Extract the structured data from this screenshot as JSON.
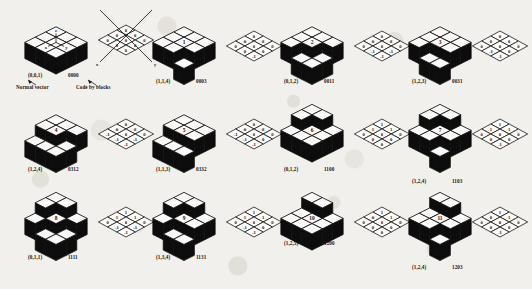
{
  "figure": {
    "type": "diagram",
    "title_visible": false,
    "background_color": "#f2f0ec",
    "ink_color": "#0d0d0d",
    "paper_color": "#fbfaf8",
    "description_visible_text": [
      "Normal vector",
      "Code by blocks"
    ],
    "rows": 3,
    "columns": 4,
    "pairs_per_cell": 2,
    "grid_size": "3x3"
  },
  "annotations": {
    "normal_vector_label": "Normal vector",
    "code_by_blocks_label": "Code by blocks",
    "first_normal_vector": "(0,0,1)",
    "first_code": "0000",
    "axis_x_label": "x",
    "axis_y_label": "y",
    "inset_axis_labels": [
      "z",
      "y",
      "x"
    ]
  },
  "panels": [
    {
      "index": 0,
      "cube_number": "",
      "normal_vector": "(0,0,1)",
      "code": "0000",
      "has_leader_lines": true,
      "has_axes": true,
      "heights": [
        [
          0,
          0,
          0
        ],
        [
          0,
          0,
          0
        ],
        [
          0,
          0,
          0
        ]
      ],
      "grid_values": [
        [
          "0",
          "0",
          "0"
        ],
        [
          "0",
          "0",
          "0"
        ],
        [
          "0",
          "0",
          "0"
        ]
      ]
    },
    {
      "index": 1,
      "cube_number": "1",
      "normal_vector": "(1,1,4)",
      "code": "0003",
      "has_leader_lines": false,
      "has_axes": false,
      "heights": [
        [
          0,
          0,
          0
        ],
        [
          0,
          0,
          0
        ],
        [
          0,
          0,
          -1
        ]
      ],
      "grid_values": [
        [
          "0",
          "0",
          "0"
        ],
        [
          "0",
          "0",
          "0"
        ],
        [
          "0",
          "0",
          "-1"
        ]
      ]
    },
    {
      "index": 2,
      "cube_number": "2",
      "normal_vector": "(0,1,2)",
      "code": "0011",
      "has_leader_lines": false,
      "has_axes": false,
      "heights": [
        [
          0,
          0,
          0
        ],
        [
          0,
          0,
          -1
        ],
        [
          0,
          -1,
          -1
        ]
      ],
      "grid_values": [
        [
          "0",
          "0",
          "0"
        ],
        [
          "0",
          "0",
          "-1"
        ],
        [
          "0",
          "-1",
          "-1"
        ]
      ]
    },
    {
      "index": 3,
      "cube_number": "3",
      "normal_vector": "(1,2,3)",
      "code": "0031",
      "has_leader_lines": false,
      "has_axes": false,
      "heights": [
        [
          0,
          0,
          0
        ],
        [
          0,
          0,
          0
        ],
        [
          0,
          -1,
          -1
        ]
      ],
      "grid_values": [
        [
          "0",
          "0",
          "0"
        ],
        [
          "0",
          "0",
          "0"
        ],
        [
          "0",
          "-1",
          "-1"
        ]
      ]
    },
    {
      "index": 4,
      "cube_number": "4",
      "normal_vector": "(1,2,4)",
      "code": "0312",
      "has_leader_lines": false,
      "has_axes": false,
      "heights": [
        [
          0,
          0,
          0
        ],
        [
          0,
          0,
          -1
        ],
        [
          -1,
          -1,
          -1
        ]
      ],
      "grid_values": [
        [
          "0",
          "0",
          "0"
        ],
        [
          "0",
          "0",
          "-1"
        ],
        [
          "-1",
          "-1",
          "-1"
        ]
      ]
    },
    {
      "index": 5,
      "cube_number": "5",
      "normal_vector": "(1,1,3)",
      "code": "0332",
      "has_leader_lines": false,
      "has_axes": false,
      "heights": [
        [
          0,
          0,
          0
        ],
        [
          0,
          0,
          0
        ],
        [
          -1,
          -1,
          -1
        ]
      ],
      "grid_values": [
        [
          "0",
          "0",
          "0"
        ],
        [
          "0",
          "0",
          "0"
        ],
        [
          "-1",
          "-1",
          "-1"
        ]
      ]
    },
    {
      "index": 6,
      "cube_number": "6",
      "normal_vector": "(0,1,2)",
      "code": "1100",
      "has_leader_lines": false,
      "has_axes": false,
      "heights": [
        [
          1,
          1,
          0
        ],
        [
          1,
          0,
          0
        ],
        [
          0,
          0,
          0
        ]
      ],
      "grid_values": [
        [
          "1",
          "1",
          "0"
        ],
        [
          "1",
          "0",
          "0"
        ],
        [
          "0",
          "0",
          "0"
        ]
      ]
    },
    {
      "index": 7,
      "cube_number": "7",
      "normal_vector": "(1,2,4)",
      "code": "1103",
      "has_leader_lines": false,
      "has_axes": false,
      "heights": [
        [
          1,
          1,
          0
        ],
        [
          1,
          0,
          0
        ],
        [
          0,
          0,
          -1
        ]
      ],
      "grid_values": [
        [
          "1",
          "1",
          "0"
        ],
        [
          "1",
          "0",
          "0"
        ],
        [
          "0",
          "0",
          "-1"
        ]
      ]
    },
    {
      "index": 8,
      "cube_number": "8",
      "normal_vector": "(0,1,1)",
      "code": "1111",
      "has_leader_lines": false,
      "has_axes": false,
      "heights": [
        [
          1,
          1,
          0
        ],
        [
          1,
          0,
          -1
        ],
        [
          0,
          -1,
          -1
        ]
      ],
      "grid_values": [
        [
          "1",
          "1",
          "0"
        ],
        [
          "1",
          "0",
          "-1"
        ],
        [
          "0",
          "-1",
          "-1"
        ]
      ]
    },
    {
      "index": 9,
      "cube_number": "9",
      "normal_vector": "(1,3,4)",
      "code": "1131",
      "has_leader_lines": false,
      "has_axes": false,
      "heights": [
        [
          1,
          1,
          0
        ],
        [
          1,
          0,
          0
        ],
        [
          0,
          -1,
          -1
        ]
      ],
      "grid_values": [
        [
          "1",
          "1",
          "0"
        ],
        [
          "1",
          "0",
          "0"
        ],
        [
          "0",
          "-1",
          "-1"
        ]
      ]
    },
    {
      "index": 10,
      "cube_number": "10",
      "normal_vector": "(1,2,5)",
      "code": "1200",
      "has_leader_lines": false,
      "has_axes": false,
      "heights": [
        [
          1,
          1,
          0
        ],
        [
          0,
          0,
          0
        ],
        [
          0,
          0,
          0
        ]
      ],
      "grid_values": [
        [
          "1",
          "1",
          "0"
        ],
        [
          "0",
          "0",
          "0"
        ],
        [
          "0",
          "0",
          "0"
        ]
      ]
    },
    {
      "index": 11,
      "cube_number": "11",
      "normal_vector": "(1,2,4)",
      "code": "1203",
      "has_leader_lines": false,
      "has_axes": false,
      "heights": [
        [
          1,
          1,
          0
        ],
        [
          0,
          0,
          0
        ],
        [
          0,
          0,
          -1
        ]
      ],
      "grid_values": [
        [
          "1",
          "1",
          "0"
        ],
        [
          "0",
          "0",
          "0"
        ],
        [
          "0",
          "0",
          "-1"
        ]
      ]
    }
  ]
}
